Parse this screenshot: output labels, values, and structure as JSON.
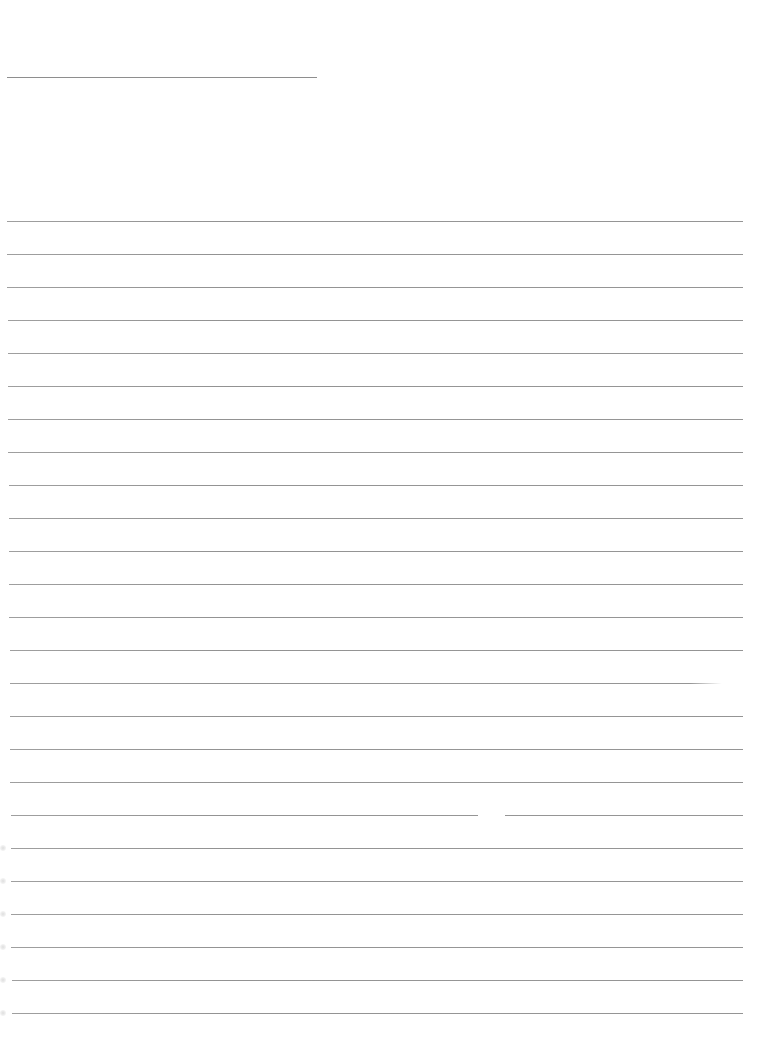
{
  "page": {
    "type": "blank-lined-sheet",
    "background_color": "#ffffff",
    "rule_color": "#8e8e8e"
  },
  "header_line": {
    "x": 7,
    "y": 77,
    "width": 310
  },
  "ruled_lines": {
    "count": 25,
    "first_y": 221,
    "spacing": 33,
    "x_start": 7,
    "x_end": 743
  },
  "artifacts": [
    {
      "type": "fade",
      "line_index": 14,
      "x_from": 690,
      "x_to": 743
    },
    {
      "type": "gap",
      "line_index": 18,
      "x_from": 478,
      "x_to": 505
    }
  ]
}
